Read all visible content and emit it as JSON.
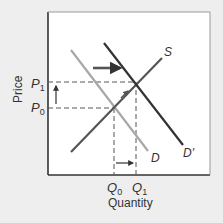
{
  "diagram": {
    "type": "supply-demand",
    "axes": {
      "ylabel": "Price",
      "xlabel": "Quantity"
    },
    "price_ticks": [
      {
        "label": "P",
        "sub": "1",
        "y": 82
      },
      {
        "label": "P",
        "sub": "0",
        "y": 108
      }
    ],
    "quantity_ticks": [
      {
        "label": "Q",
        "sub": "0",
        "x": 114
      },
      {
        "label": "Q",
        "sub": "1",
        "x": 136
      }
    ],
    "curves": {
      "supply": {
        "label": "S",
        "color": "#555555",
        "from": [
          71,
          152
        ],
        "to": [
          162,
          58
        ]
      },
      "demand": {
        "label": "D",
        "color": "#a8a8a8",
        "from": [
          71,
          50
        ],
        "to": [
          148,
          151
        ]
      },
      "demand_new": {
        "label": "D'",
        "color": "#333333",
        "from": [
          104,
          43
        ],
        "to": [
          183,
          145
        ]
      }
    },
    "arrows": {
      "demand_shift": "right",
      "price_change": "up",
      "quantity_change": "right"
    },
    "colors": {
      "background": "#eeeeee",
      "plot_area": "#ffffff",
      "frame": "#333333",
      "dashed": "#555555"
    }
  }
}
